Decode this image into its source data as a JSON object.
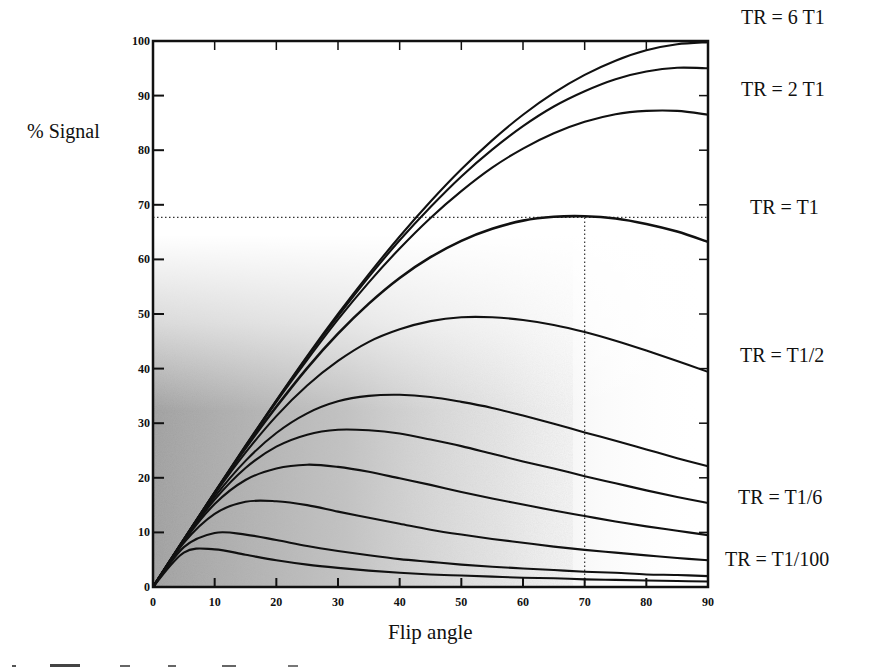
{
  "figure": {
    "ylabel": "% Signal",
    "xlabel": "Flip angle",
    "curve_labels": [
      {
        "text": "TR = 6 T1",
        "x": 741,
        "y": 6
      },
      {
        "text": "TR = 2 T1",
        "x": 741,
        "y": 78
      },
      {
        "text": "TR = T1",
        "x": 750,
        "y": 196
      },
      {
        "text": "TR = T1/2",
        "x": 740,
        "y": 344
      },
      {
        "text": "TR = T1/6",
        "x": 738,
        "y": 486
      },
      {
        "text": "TR = T1/100",
        "x": 725,
        "y": 548
      }
    ]
  },
  "chart_data": {
    "type": "line",
    "title": "",
    "xlabel": "Flip angle",
    "ylabel": "% Signal",
    "xlim": [
      0,
      90
    ],
    "ylim": [
      0,
      100
    ],
    "xticks": [
      0,
      10,
      20,
      30,
      40,
      50,
      60,
      70,
      80,
      90
    ],
    "yticks": [
      0,
      10,
      20,
      30,
      40,
      50,
      60,
      70,
      80,
      90,
      100
    ],
    "grid": false,
    "legend": "labels at right edge of curves",
    "annotations": [
      {
        "type": "hline-dotted",
        "y": 67.7,
        "x_from": 0,
        "x_to": 90
      },
      {
        "type": "vline-dotted",
        "x": 70,
        "y_from": 0,
        "y_to": 67.7
      }
    ],
    "x": [
      0,
      5,
      10,
      15,
      20,
      25,
      30,
      35,
      40,
      45,
      50,
      55,
      60,
      65,
      70,
      75,
      80,
      85,
      90
    ],
    "series": [
      {
        "name": "TR = 6 T1",
        "values": [
          0,
          8.7,
          17.4,
          25.9,
          34.2,
          42.3,
          50.0,
          57.3,
          64.2,
          70.6,
          76.5,
          81.8,
          86.5,
          90.5,
          93.8,
          96.4,
          98.3,
          99.4,
          99.8
        ]
      },
      {
        "name": "TR = 3 T1",
        "values": [
          0,
          8.7,
          17.3,
          25.8,
          34.1,
          42.1,
          49.6,
          56.8,
          63.5,
          69.6,
          75.2,
          80.1,
          84.4,
          88.0,
          90.8,
          93.0,
          94.4,
          95.1,
          95.0
        ]
      },
      {
        "name": "TR = 2 T1",
        "values": [
          0,
          8.7,
          17.3,
          25.7,
          33.9,
          41.6,
          49.0,
          55.8,
          62.0,
          67.6,
          72.5,
          76.8,
          80.3,
          83.1,
          85.2,
          86.6,
          87.2,
          87.2,
          86.5
        ]
      },
      {
        "name": "TR = T1",
        "values": [
          0,
          8.7,
          17.2,
          25.4,
          33.0,
          40.1,
          46.4,
          51.9,
          56.6,
          60.4,
          63.4,
          65.6,
          67.1,
          67.8,
          67.9,
          67.5,
          66.5,
          65.1,
          63.2
        ]
      },
      {
        "name": "TR = T1/2",
        "values": [
          0,
          8.7,
          17.0,
          24.6,
          31.3,
          36.9,
          41.4,
          44.9,
          47.2,
          48.7,
          49.4,
          49.4,
          48.9,
          48.0,
          46.7,
          45.1,
          43.3,
          41.4,
          39.4
        ]
      },
      {
        "name": "TR = T1/4",
        "values": [
          0,
          8.6,
          16.5,
          23.1,
          28.2,
          31.8,
          34.0,
          35.0,
          35.2,
          34.8,
          33.9,
          32.8,
          31.4,
          29.9,
          28.3,
          26.8,
          25.2,
          23.6,
          22.1
        ]
      },
      {
        "name": "TR = T1/6",
        "values": [
          0,
          8.5,
          16.0,
          21.8,
          25.7,
          27.9,
          28.8,
          28.7,
          28.1,
          27.0,
          25.8,
          24.4,
          23.0,
          21.7,
          20.3,
          19.0,
          17.7,
          16.5,
          15.4
        ]
      },
      {
        "name": "TR = T1/10",
        "values": [
          0,
          8.4,
          15.2,
          19.6,
          21.7,
          22.4,
          22.0,
          21.1,
          19.9,
          18.7,
          17.4,
          16.2,
          15.1,
          14.0,
          13.0,
          12.0,
          11.1,
          10.3,
          9.5
        ]
      },
      {
        "name": "TR = T1/20",
        "values": [
          0,
          8.1,
          13.4,
          15.6,
          15.7,
          15.0,
          13.8,
          12.7,
          11.6,
          10.5,
          9.6,
          8.8,
          8.1,
          7.4,
          6.8,
          6.3,
          5.8,
          5.3,
          4.9
        ]
      },
      {
        "name": "TR = T1/50",
        "values": [
          0,
          7.3,
          9.9,
          9.6,
          8.6,
          7.5,
          6.6,
          5.8,
          5.1,
          4.6,
          4.1,
          3.7,
          3.4,
          3.1,
          2.8,
          2.6,
          2.3,
          2.2,
          2.0
        ]
      },
      {
        "name": "TR = T1/100",
        "values": [
          0,
          6.3,
          6.9,
          5.9,
          4.9,
          4.1,
          3.5,
          3.0,
          2.6,
          2.3,
          2.1,
          1.9,
          1.7,
          1.6,
          1.4,
          1.3,
          1.2,
          1.1,
          1.0
        ]
      }
    ],
    "colors": {
      "line": "#111111",
      "axis": "#111111",
      "background_shade": "#9a9a9a"
    }
  }
}
